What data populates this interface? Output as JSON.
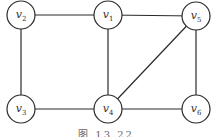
{
  "diagram": {
    "type": "undirected-graph",
    "caption": "图 13.22",
    "nodes": [
      {
        "id": "v1",
        "base": "v",
        "sub": "1",
        "x": 108,
        "y": 15
      },
      {
        "id": "v2",
        "base": "v",
        "sub": "2",
        "x": 21,
        "y": 15
      },
      {
        "id": "v3",
        "base": "v",
        "sub": "3",
        "x": 21,
        "y": 109
      },
      {
        "id": "v4",
        "base": "v",
        "sub": "4",
        "x": 108,
        "y": 109
      },
      {
        "id": "v5",
        "base": "v",
        "sub": "5",
        "x": 196,
        "y": 16
      },
      {
        "id": "v6",
        "base": "v",
        "sub": "6",
        "x": 196,
        "y": 109
      }
    ],
    "edges": [
      [
        "v2",
        "v1"
      ],
      [
        "v1",
        "v5"
      ],
      [
        "v2",
        "v3"
      ],
      [
        "v1",
        "v4"
      ],
      [
        "v5",
        "v4"
      ],
      [
        "v5",
        "v6"
      ],
      [
        "v3",
        "v4"
      ],
      [
        "v4",
        "v6"
      ]
    ]
  }
}
